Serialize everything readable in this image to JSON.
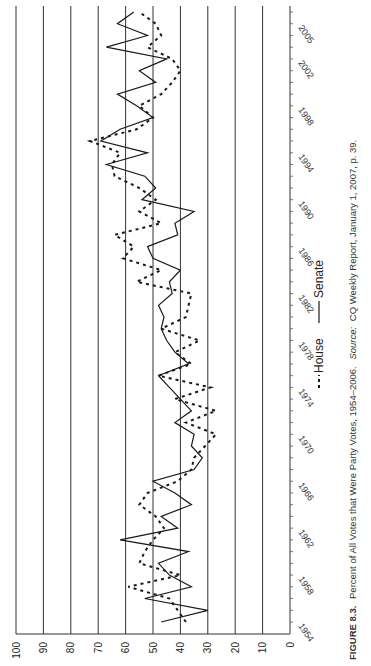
{
  "chart_data": {
    "type": "line",
    "title": "Percent of All Votes that Were Party Votes, 1954–2006",
    "caption": {
      "figure_label": "FIGURE 8.3.",
      "text": "Percent of All Votes that Were Party Votes, 1954–2006.",
      "source_label": "Source:",
      "source_text": "CQ Weekly Report, January 1, 2007, p. 39."
    },
    "orientation": "rotated-90-clockwise",
    "xlabel": "",
    "ylabel": "",
    "ylim": [
      0,
      100
    ],
    "y_ticks": [
      0,
      10,
      20,
      30,
      40,
      50,
      60,
      70,
      80,
      90,
      100
    ],
    "x_tick_labels": [
      "1954",
      "1958",
      "1962",
      "1966",
      "1970",
      "1974",
      "1978",
      "1982",
      "1986",
      "1990",
      "1994",
      "1998",
      "2002",
      "2005"
    ],
    "grid": true,
    "legend_position": "right (below plot after rotation)",
    "x": [
      1954,
      1955,
      1956,
      1957,
      1958,
      1959,
      1960,
      1961,
      1962,
      1963,
      1964,
      1965,
      1966,
      1967,
      1968,
      1969,
      1970,
      1971,
      1972,
      1973,
      1974,
      1975,
      1976,
      1977,
      1978,
      1979,
      1980,
      1981,
      1982,
      1983,
      1984,
      1985,
      1986,
      1987,
      1988,
      1989,
      1990,
      1991,
      1992,
      1993,
      1994,
      1995,
      1996,
      1997,
      1998,
      1999,
      2000,
      2001,
      2002,
      2003,
      2004,
      2005,
      2006
    ],
    "series": [
      {
        "name": "House",
        "style": "dashed",
        "values": [
          38,
          41,
          44,
          59,
          40,
          55,
          53,
          50,
          46,
          49,
          55,
          52,
          41,
          36,
          35,
          31,
          27,
          38,
          27,
          42,
          29,
          48,
          36,
          42,
          33,
          47,
          38,
          37,
          36,
          56,
          47,
          61,
          57,
          64,
          47,
          55,
          49,
          55,
          64,
          65,
          62,
          73,
          56,
          50,
          55,
          47,
          43,
          40,
          43,
          52,
          47,
          49,
          55
        ]
      },
      {
        "name": "Senate",
        "style": "solid",
        "values": [
          47,
          30,
          53,
          36,
          44,
          48,
          37,
          62,
          41,
          47,
          36,
          42,
          50,
          35,
          32,
          36,
          35,
          42,
          36,
          40,
          44,
          48,
          37,
          42,
          45,
          47,
          46,
          48,
          43,
          44,
          40,
          50,
          52,
          41,
          42,
          35,
          54,
          49,
          53,
          67,
          52,
          69,
          62,
          50,
          56,
          63,
          49,
          55,
          45,
          67,
          52,
          63,
          57
        ]
      }
    ]
  },
  "legend": {
    "house_label": "House",
    "senate_label": "Senate"
  },
  "colors": {
    "line": "#1a1a1a",
    "grid": "#333333",
    "axis": "#555555",
    "text": "#222222"
  }
}
